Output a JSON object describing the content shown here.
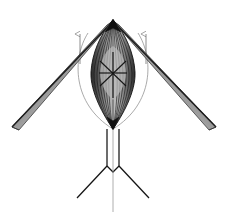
{
  "figure": {
    "title": "Rotorcraft front-view wireframe",
    "background_color": "#ffffff",
    "width": 229,
    "height": 221
  },
  "palette": {
    "outline_dark": "#1a1a1a",
    "blade_edge": "#2b2b2b",
    "blade_fill_light": "#b4b4b4",
    "blade_fill_mid": "#8c8c8c",
    "body_fill_light": "#b8b8b8",
    "body_fill_mid": "#9a9a9a",
    "body_fill_dark": "#3a3a3a",
    "rib_line": "#111111",
    "arc_line": "#7a7a7a",
    "arrow_line": "#6e6e6e",
    "gear_line": "#141414",
    "mast_line": "#8a8a8a"
  },
  "parts": {
    "apex": {
      "name": "rotor hub apex",
      "x": 113,
      "y": 20
    },
    "fuselage": {
      "name": "fuselage body",
      "top_y": 20,
      "bottom_y": 129,
      "max_half_width": 22,
      "widest_y": 72,
      "rib_count": 14
    },
    "cross_brace": {
      "name": "central X brace",
      "center_x": 113,
      "center_y": 73,
      "half_width": 14,
      "half_height": 13
    },
    "blade_left": {
      "name": "left rotor blade",
      "root_x": 113,
      "root_y": 21,
      "tip_x": 17,
      "tip_y": 124,
      "chord": 7
    },
    "blade_right": {
      "name": "right rotor blade",
      "root_x": 113,
      "root_y": 21,
      "tip_x": 211,
      "tip_y": 124,
      "chord": 7
    },
    "arrow_left": {
      "name": "left lift arrow",
      "x": 80,
      "tail_y": 64,
      "head_y": 34
    },
    "arrow_right": {
      "name": "right lift arrow",
      "x": 146,
      "tail_y": 64,
      "head_y": 34
    },
    "disc_arc_left": {
      "name": "left rotor disc arc",
      "start_x": 88,
      "start_y": 33,
      "end_x": 113,
      "end_y": 129,
      "bulge_x": 72
    },
    "disc_arc_right": {
      "name": "right rotor disc arc",
      "start_x": 138,
      "start_y": 33,
      "end_x": 113,
      "end_y": 129,
      "bulge_x": 154
    },
    "gear": {
      "name": "tripod landing gear",
      "strut_left_x": 106,
      "strut_right_x": 120,
      "strut_top_y": 129,
      "junction_y": 168,
      "leg_left_tip_x": 77,
      "leg_left_tip_y": 198,
      "leg_right_tip_x": 149,
      "leg_right_tip_y": 198,
      "mast_x": 113,
      "mast_bottom_y": 212
    }
  }
}
